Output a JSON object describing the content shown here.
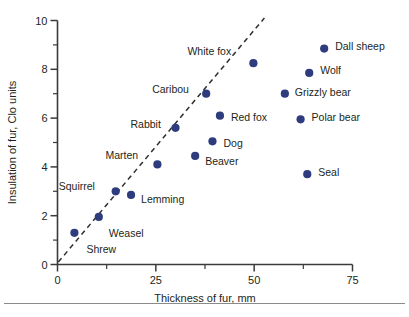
{
  "chart_data": {
    "type": "scatter",
    "title": "",
    "xlabel": "Thickness of fur, mm",
    "ylabel": "Insulation of fur, Clo units",
    "xlim": [
      0,
      75
    ],
    "ylim": [
      0,
      10
    ],
    "x_ticks": [
      0,
      12.5,
      25,
      37.5,
      50,
      62.5,
      75
    ],
    "x_tick_labels": [
      "0",
      "",
      "25",
      "",
      "50",
      "",
      "75"
    ],
    "y_ticks": [
      0,
      1,
      2,
      3,
      4,
      5,
      6,
      7,
      8,
      9,
      10
    ],
    "y_tick_labels": [
      "0",
      "",
      "2",
      "",
      "4",
      "",
      "6",
      "",
      "8",
      "",
      "10"
    ],
    "grid": false,
    "legend": "none",
    "marker_color": "#2e3c7e",
    "points": [
      {
        "label": "Shrew",
        "x": 4.3,
        "y": 1.3,
        "label_dx": 12,
        "label_dy": 20
      },
      {
        "label": "Weasel",
        "x": 10.5,
        "y": 1.95,
        "label_dx": 10,
        "label_dy": 20
      },
      {
        "label": "Squirrel",
        "x": 14.8,
        "y": 3.0,
        "label_dx": -57,
        "label_dy": -1
      },
      {
        "label": "Lemming",
        "x": 18.7,
        "y": 2.85,
        "label_dx": 10,
        "label_dy": 8
      },
      {
        "label": "Marten",
        "x": 25.4,
        "y": 4.1,
        "label_dx": -52,
        "label_dy": -5
      },
      {
        "label": "Rabbit",
        "x": 30.0,
        "y": 5.6,
        "label_dx": -45,
        "label_dy": 0
      },
      {
        "label": "Beaver",
        "x": 35.0,
        "y": 4.45,
        "label_dx": 10,
        "label_dy": 9
      },
      {
        "label": "Caribou",
        "x": 37.8,
        "y": 7.0,
        "label_dx": -54,
        "label_dy": -1
      },
      {
        "label": "Dog",
        "x": 39.4,
        "y": 5.05,
        "label_dx": 11,
        "label_dy": 6
      },
      {
        "label": "Red fox",
        "x": 41.3,
        "y": 6.1,
        "label_dx": 11,
        "label_dy": 5
      },
      {
        "label": "White fox",
        "x": 49.8,
        "y": 8.25,
        "label_dx": -66,
        "label_dy": -8
      },
      {
        "label": "Grizzly bear",
        "x": 57.8,
        "y": 7.0,
        "label_dx": 10,
        "label_dy": 2
      },
      {
        "label": "Polar bear",
        "x": 61.8,
        "y": 5.95,
        "label_dx": 11,
        "label_dy": 2
      },
      {
        "label": "Seal",
        "x": 63.5,
        "y": 3.7,
        "label_dx": 11,
        "label_dy": 2
      },
      {
        "label": "Wolf",
        "x": 64.0,
        "y": 7.85,
        "label_dx": 11,
        "label_dy": 1
      },
      {
        "label": "Dall sheep",
        "x": 67.8,
        "y": 8.85,
        "label_dx": 11,
        "label_dy": 1
      }
    ],
    "trend_line": {
      "style": "dashed",
      "x_start": 0.2,
      "y_start": 0.1,
      "x_end": 52.6,
      "y_end": 10.1
    }
  }
}
